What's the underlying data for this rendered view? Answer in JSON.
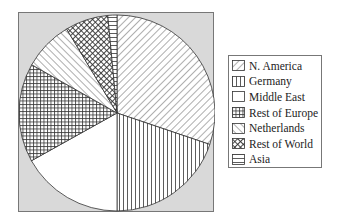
{
  "chart_data": {
    "type": "pie",
    "title": "",
    "start_angle_deg": 0,
    "direction": "clockwise",
    "categories": [
      "N. America",
      "Germany",
      "Middle East",
      "Rest of Europe",
      "Netherlands",
      "Rest of World",
      "Asia"
    ],
    "values": [
      30.2,
      19.8,
      16.9,
      16.3,
      8.2,
      7.1,
      1.5
    ],
    "unit": "percent (estimated)",
    "patterns": [
      "diagonal-down",
      "vertical",
      "none",
      "grid",
      "diagonal-up",
      "crosshatch-diagonal",
      "horizontal"
    ],
    "legend_position": "right",
    "colors": {
      "frame_bg": "#d9d9d9",
      "slice_fill": "#ffffff",
      "stroke": "#333333"
    }
  },
  "legend": {
    "items": [
      {
        "label": "N. America",
        "pattern": "diagonal-down"
      },
      {
        "label": "Germany",
        "pattern": "vertical"
      },
      {
        "label": "Middle East",
        "pattern": "none"
      },
      {
        "label": "Rest of Europe",
        "pattern": "grid"
      },
      {
        "label": "Netherlands",
        "pattern": "diagonal-up"
      },
      {
        "label": "Rest of World",
        "pattern": "crosshatch-diagonal"
      },
      {
        "label": "Asia",
        "pattern": "horizontal"
      }
    ]
  }
}
